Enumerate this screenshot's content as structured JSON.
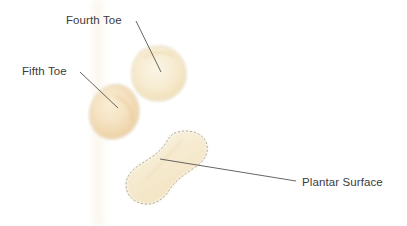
{
  "figure": {
    "background_color": "#ffffff",
    "width": 407,
    "height": 226
  },
  "annotations": [
    {
      "id": "fourth-toe",
      "label": "Fourth Toe",
      "text_color": "#3b3b3b",
      "leader_color": "#54544e",
      "leader_from": [
        136,
        21
      ],
      "leader_to": [
        161,
        72
      ]
    },
    {
      "id": "fifth-toe",
      "label": "Fifth Toe",
      "text_color": "#3b3b3b",
      "leader_color": "#54544e",
      "leader_from": [
        80,
        72
      ],
      "leader_to": [
        118,
        108
      ]
    },
    {
      "id": "plantar-surface",
      "label": "Plantar Surface",
      "text_color": "#3b3b3b",
      "leader_color": "#54544e",
      "leader_from": [
        296,
        181
      ],
      "leader_to": [
        160,
        159
      ]
    }
  ],
  "specimens": [
    {
      "id": "fourth-toe-tissue",
      "name": "Fourth Toe tissue section",
      "fill_color": "#f7ecd2",
      "accent_color": "#edd9ae",
      "edge_color": "#b9b8ad",
      "edge_style": "dashed"
    },
    {
      "id": "fifth-toe-tissue",
      "name": "Fifth Toe tissue section",
      "fill_color": "#f6e4c1",
      "accent_color": "#eccf9f",
      "edge_color": "#c3bda8",
      "edge_style": "soft"
    },
    {
      "id": "plantar-surface-tissue",
      "name": "Plantar Surface tissue section",
      "fill_color": "#f8efd8",
      "accent_color": "#eeddb6",
      "edge_color": "#8f9189",
      "edge_style": "dashed"
    }
  ],
  "background_band": {
    "name": "faint vertical scan band",
    "color": "#faf6ea"
  }
}
